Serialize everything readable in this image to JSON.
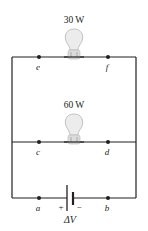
{
  "diagram": {
    "type": "circuit",
    "bulbs": [
      {
        "label": "30 W",
        "left_node": "e",
        "right_node": "f"
      },
      {
        "label": "60 W",
        "left_node": "c",
        "right_node": "d"
      }
    ],
    "nodes": {
      "e": "e",
      "f": "f",
      "c": "c",
      "d": "d",
      "a": "a",
      "b": "b"
    },
    "battery": {
      "plus": "+",
      "minus": "−",
      "label": "ΔV"
    },
    "colors": {
      "wire": "#231f20",
      "bulb_glass": "#e6e6e6",
      "bulb_outline": "#b5b5b5",
      "background": "#ffffff"
    }
  }
}
